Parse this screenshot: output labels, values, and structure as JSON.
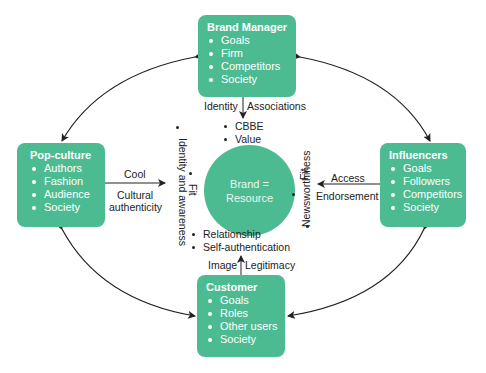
{
  "center": {
    "line1": "Brand =",
    "line2": "Resource"
  },
  "nodes": {
    "brand_manager": {
      "title": "Brand Manager",
      "items": [
        "Goals",
        "Firm",
        "Competitors",
        "Society"
      ]
    },
    "pop_culture": {
      "title": "Pop-culture",
      "items": [
        "Authors",
        "Fashion",
        "Audience",
        "Society"
      ]
    },
    "influencers": {
      "title": "Influencers",
      "items": [
        "Goals",
        "Followers",
        "Competitors",
        "Society"
      ]
    },
    "customer": {
      "title": "Customer",
      "items": [
        "Goals",
        "Roles",
        "Other users",
        "Society"
      ]
    }
  },
  "edges": {
    "brand_manager": {
      "left": "Identity",
      "right": "Associations",
      "outcomes": [
        "CBBE",
        "Value"
      ]
    },
    "pop_culture": {
      "top": "Cool",
      "bottom1": "Cultural",
      "bottom2": "authenticity",
      "outcomes": [
        "Identity and awareness",
        "Fit"
      ]
    },
    "influencers": {
      "top": "Access",
      "bottom": "Endorsement",
      "outcomes": [
        "Fit",
        "Newsworthiness"
      ]
    },
    "customer": {
      "left": "Image",
      "right": "Legitimacy",
      "outcomes": [
        "Relationship",
        "Self-authentication"
      ]
    }
  },
  "colors": {
    "node_fill": "#4dbb92",
    "text": "#222222",
    "edge": "#222222"
  }
}
